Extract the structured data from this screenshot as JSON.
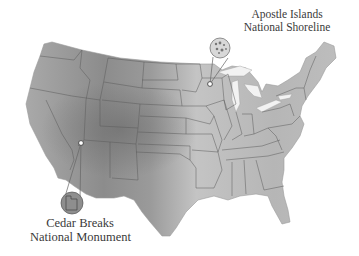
{
  "map": {
    "type": "relief map",
    "region": "Contiguous United States",
    "colors": {
      "land_light": "#d4d4d4",
      "land_mid": "#a8a8a8",
      "land_dark": "#7a7a7a",
      "state_border": "#555555",
      "water": "#ffffff",
      "callout": "#8a8a8a"
    },
    "callouts": [
      {
        "id": "apostle-islands",
        "line1": "Apostle Islands",
        "line2": "National Shoreline",
        "marker_position": "northern Wisconsin, Lake Superior shore",
        "inset_content": "island cluster"
      },
      {
        "id": "cedar-breaks",
        "line1": "Cedar Breaks",
        "line2": "National Monument",
        "marker_position": "southwestern Utah",
        "inset_content": "Utah state outline"
      }
    ]
  }
}
